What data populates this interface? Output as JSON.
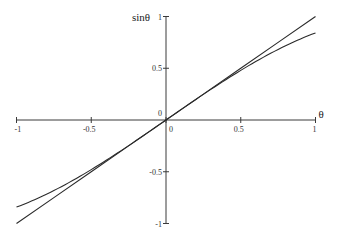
{
  "chart_data": {
    "type": "line",
    "title": "",
    "xlabel": "θ",
    "ylabel": "sinθ",
    "xlim": [
      -1,
      1
    ],
    "ylim": [
      -1,
      1
    ],
    "grid": false,
    "legend": null,
    "x_ticks": [
      {
        "value": -1,
        "label": "-1"
      },
      {
        "value": -0.5,
        "label": "-0.5"
      },
      {
        "value": 0,
        "label": "0"
      },
      {
        "value": 0.5,
        "label": "0.5"
      },
      {
        "value": 1,
        "label": "1"
      }
    ],
    "y_ticks": [
      {
        "value": 1,
        "label": "1"
      },
      {
        "value": 0.5,
        "label": "0.5"
      },
      {
        "value": 0,
        "label": "0"
      },
      {
        "value": -0.5,
        "label": "-0.5"
      },
      {
        "value": -1,
        "label": "-1"
      }
    ],
    "series": [
      {
        "name": "θ",
        "x": [
          -1,
          -0.75,
          -0.5,
          -0.25,
          0,
          0.25,
          0.5,
          0.75,
          1
        ],
        "values": [
          -1,
          -0.75,
          -0.5,
          -0.25,
          0,
          0.25,
          0.5,
          0.75,
          1
        ]
      },
      {
        "name": "sinθ",
        "x": [
          -1,
          -0.875,
          -0.75,
          -0.625,
          -0.5,
          -0.375,
          -0.25,
          -0.125,
          0,
          0.125,
          0.25,
          0.375,
          0.5,
          0.625,
          0.75,
          0.875,
          1
        ],
        "values": [
          -0.841,
          -0.767,
          -0.682,
          -0.585,
          -0.479,
          -0.366,
          -0.247,
          -0.125,
          0,
          0.125,
          0.247,
          0.366,
          0.479,
          0.585,
          0.682,
          0.767,
          0.841
        ]
      }
    ]
  },
  "layout": {
    "origin_px": [
      166,
      120
    ],
    "x_scale_px": 149.5,
    "y_scale_px": 103.5
  }
}
